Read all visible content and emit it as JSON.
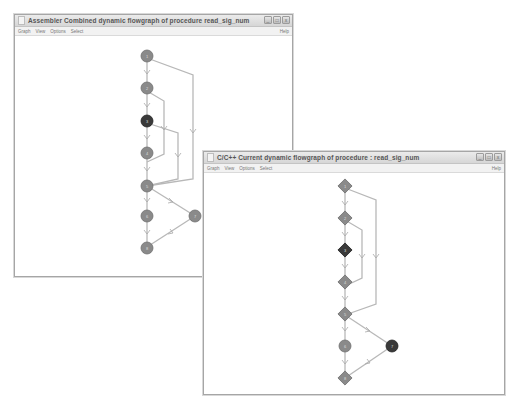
{
  "windows": [
    {
      "id": "assembler",
      "title": "Assembler Combined dynamic flowgraph of procedure read_sig_num",
      "menu": [
        "Graph",
        "View",
        "Options",
        "Select"
      ],
      "help": "Help",
      "controls": {
        "minimize": "_",
        "maximize": "□",
        "close": "x"
      },
      "node_shape": "circle",
      "nodes": [
        {
          "label": "1",
          "state": "normal"
        },
        {
          "label": "2",
          "state": "normal"
        },
        {
          "label": "3",
          "state": "highlighted"
        },
        {
          "label": "4",
          "state": "normal"
        },
        {
          "label": "5",
          "state": "normal"
        },
        {
          "label": "6",
          "state": "normal"
        },
        {
          "label": "7",
          "state": "normal"
        },
        {
          "label": "8",
          "state": "normal"
        }
      ]
    },
    {
      "id": "c-source",
      "title": "C/C++ Current dynamic flowgraph of procedure : read_sig_num",
      "menu": [
        "Graph",
        "View",
        "Options",
        "Select"
      ],
      "help": "Help",
      "controls": {
        "minimize": "_",
        "maximize": "□",
        "close": "x"
      },
      "node_shape": "diamond",
      "nodes": [
        {
          "label": "1",
          "state": "normal"
        },
        {
          "label": "2",
          "state": "normal"
        },
        {
          "label": "3",
          "state": "highlighted"
        },
        {
          "label": "4",
          "state": "normal"
        },
        {
          "label": "5",
          "state": "normal"
        },
        {
          "label": "6",
          "state": "circle"
        },
        {
          "label": "7",
          "state": "highlighted-circle"
        },
        {
          "label": "8",
          "state": "normal"
        }
      ]
    }
  ],
  "colors": {
    "node_fill": "#8a8a8a",
    "node_highlight": "#3a3a3a",
    "edge": "#b8b8b8",
    "window_border": "#a6a6a6"
  }
}
